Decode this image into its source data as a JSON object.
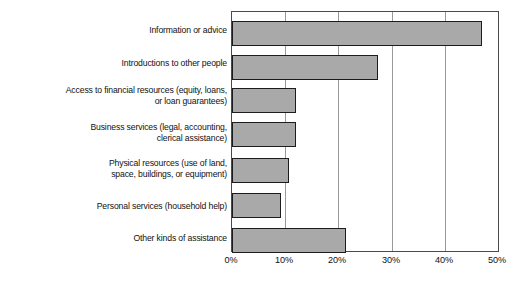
{
  "chart_data": {
    "type": "bar",
    "orientation": "horizontal",
    "title": "",
    "subtitle": "",
    "xlabel": "",
    "ylabel": "",
    "xlim": [
      0,
      50
    ],
    "ylim": null,
    "grid": true,
    "legend": null,
    "legend_position": "none",
    "value_suffix": "%",
    "categories": [
      "Information or advice",
      "Introductions to other people",
      "Access to financial resources (equity, loans,\nor loan guarantees)",
      "Business services (legal, accounting,\nclerical assistance)",
      "Physical resources (use of land,\nspace, buildings, or equipment)",
      "Personal services (household help)",
      "Other kinds of assistance"
    ],
    "values": [
      47,
      27.5,
      12,
      12,
      10.7,
      9.3,
      21.5
    ],
    "xticks": [
      0,
      10,
      20,
      30,
      40,
      50
    ],
    "xticklabels": [
      "0%",
      "10%",
      "20%",
      "30%",
      "40%",
      "50%"
    ]
  },
  "style": {
    "bar_fill": "#a9a9a9",
    "bar_border": "#1c1c1c",
    "grid_color": "#9a9a9a",
    "frame_color": "#4a4a4a",
    "text_color": "#111111",
    "background": "#ffffff"
  }
}
